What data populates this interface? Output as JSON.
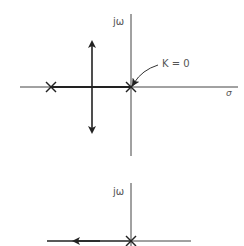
{
  "diagram": {
    "top": {
      "imag_axis_label": "jω",
      "real_axis_label": "σ",
      "annotation": "K = 0",
      "poles": [
        {
          "x": 51,
          "y": 87
        },
        {
          "x": 131,
          "y": 87
        }
      ],
      "axis_color": "#333333"
    },
    "bottom": {
      "imag_axis_label": "jω",
      "poles": [
        {
          "x": 131,
          "y": 241
        }
      ]
    }
  }
}
